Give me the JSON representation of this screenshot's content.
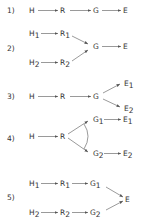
{
  "diagrams": [
    {
      "label": "1)",
      "nodes": [
        "H",
        "R",
        "G",
        "E"
      ],
      "edges": [
        [
          "H",
          "R"
        ],
        [
          "R",
          "G"
        ],
        [
          "G",
          "E"
        ]
      ]
    },
    {
      "label": "2)",
      "nodes": [
        "H1",
        "R1",
        "H2",
        "R2",
        "G",
        "E"
      ],
      "edges": [
        [
          "H1",
          "R1"
        ],
        [
          "H2",
          "R2"
        ],
        [
          "R1",
          "G"
        ],
        [
          "R2",
          "G"
        ],
        [
          "G",
          "E"
        ]
      ]
    },
    {
      "label": "3)",
      "nodes": [
        "H",
        "R",
        "G",
        "E1",
        "E2"
      ],
      "edges": [
        [
          "H",
          "R"
        ],
        [
          "R",
          "G"
        ],
        [
          "G",
          "E1"
        ],
        [
          "G",
          "E2"
        ]
      ]
    },
    {
      "label": "4)",
      "nodes": [
        "H",
        "R",
        "G1",
        "G2",
        "E1",
        "E2"
      ],
      "edges": [
        [
          "H",
          "R"
        ],
        [
          "R",
          "G1"
        ],
        [
          "R",
          "G2"
        ],
        [
          "G1",
          "E1"
        ],
        [
          "G2",
          "E2"
        ]
      ],
      "annotation": "arc between R→G1 and R→G2"
    },
    {
      "label": "5)",
      "nodes": [
        "H1",
        "R1",
        "G1",
        "H2",
        "R2",
        "G2",
        "E"
      ],
      "edges": [
        [
          "H1",
          "R1"
        ],
        [
          "R1",
          "G1"
        ],
        [
          "H2",
          "R2"
        ],
        [
          "R2",
          "G2"
        ],
        [
          "G1",
          "E"
        ],
        [
          "G2",
          "E"
        ]
      ]
    }
  ],
  "text": {
    "l1": "1)",
    "l2": "2)",
    "l3": "3)",
    "l4": "4)",
    "l5": "5)",
    "H": "H",
    "R": "R",
    "G": "G",
    "E": "E",
    "sub1": "1",
    "sub2": "2"
  }
}
